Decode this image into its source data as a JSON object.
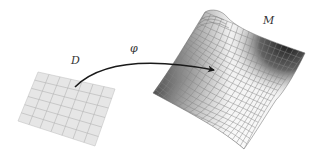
{
  "figure": {
    "type": "mapping-diagram",
    "domain": {
      "label": "D",
      "grid_cols": 7,
      "grid_rows": 6,
      "fill": "#e6e6e6",
      "grid_color": "#b5b5b5"
    },
    "map": {
      "label": "φ",
      "arrow_color": "#1a1a1a"
    },
    "manifold": {
      "label": "M",
      "grid_color": "#8a8a8a",
      "shade_dark": "#2a2a2a",
      "shade_light": "#f4f4f4"
    }
  }
}
